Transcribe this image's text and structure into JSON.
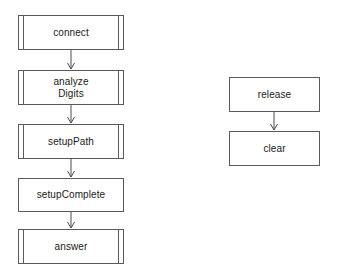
{
  "diagram": {
    "background_color": "#ffffff",
    "stroke_color": "#5a5a5a",
    "arrow_color": "#4d4d4d",
    "text_color": "#1a1a1a",
    "columns": [
      {
        "name": "main-sequence",
        "nodes": [
          {
            "id": "connect",
            "label": "connect",
            "shape": "subroutine",
            "x": 18,
            "y": 15,
            "w": 106,
            "h": 35
          },
          {
            "id": "analyzeDigits",
            "label": "analyze\nDigits",
            "shape": "subroutine",
            "x": 18,
            "y": 70,
            "w": 106,
            "h": 35
          },
          {
            "id": "setupPath",
            "label": "setupPath",
            "shape": "subroutine",
            "x": 18,
            "y": 124,
            "w": 106,
            "h": 35
          },
          {
            "id": "setupComplete",
            "label": "setupComplete",
            "shape": "process",
            "x": 18,
            "y": 178,
            "w": 106,
            "h": 34
          },
          {
            "id": "answer",
            "label": "answer",
            "shape": "subroutine",
            "x": 18,
            "y": 229,
            "w": 106,
            "h": 35
          }
        ],
        "edges": [
          {
            "from": "connect",
            "to": "analyzeDigits",
            "x": 71,
            "y1": 50,
            "y2": 70
          },
          {
            "from": "analyzeDigits",
            "to": "setupPath",
            "x": 71,
            "y1": 105,
            "y2": 124
          },
          {
            "from": "setupPath",
            "to": "setupComplete",
            "x": 71,
            "y1": 159,
            "y2": 178
          },
          {
            "from": "setupComplete",
            "to": "answer",
            "x": 71,
            "y1": 212,
            "y2": 229
          }
        ]
      },
      {
        "name": "teardown-sequence",
        "nodes": [
          {
            "id": "release",
            "label": "release",
            "shape": "process",
            "x": 229,
            "y": 77,
            "w": 91,
            "h": 35
          },
          {
            "id": "clear",
            "label": "clear",
            "shape": "process",
            "x": 229,
            "y": 131,
            "w": 91,
            "h": 35
          }
        ],
        "edges": [
          {
            "from": "release",
            "to": "clear",
            "x": 274,
            "y1": 112,
            "y2": 131
          }
        ]
      }
    ]
  }
}
